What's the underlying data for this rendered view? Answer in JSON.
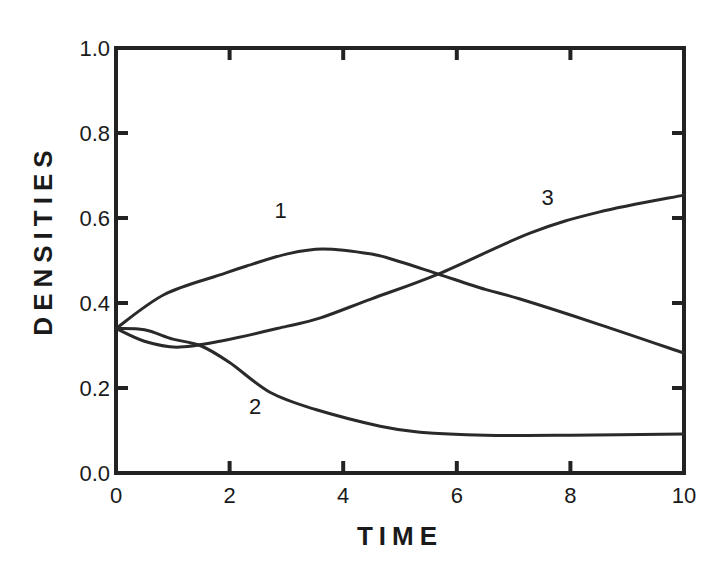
{
  "chart_data": {
    "type": "line",
    "title": "",
    "xlabel": "TIME",
    "ylabel": "DENSITIES",
    "xlim": [
      0,
      10
    ],
    "ylim": [
      0.0,
      1.0
    ],
    "x_ticks": [
      0,
      2,
      4,
      6,
      8,
      10
    ],
    "x_tick_labels": [
      "0",
      "2",
      "4",
      "6",
      "8",
      "10"
    ],
    "y_ticks": [
      0.0,
      0.2,
      0.4,
      0.6,
      0.8,
      1.0
    ],
    "y_tick_labels": [
      "0.0",
      "0.2",
      "0.4",
      "0.6",
      "0.8",
      "1.0"
    ],
    "grid": false,
    "legend": "inline curve labels",
    "series": [
      {
        "name": "1",
        "label_pos": [
          2.9,
          0.6
        ],
        "x": [
          0,
          0.85,
          1.83,
          2.3,
          3.0,
          3.64,
          4.5,
          5.0,
          5.67,
          6.5,
          7.1,
          8.5,
          10
        ],
        "values": [
          0.34,
          0.42,
          0.466,
          0.487,
          0.515,
          0.527,
          0.515,
          0.497,
          0.468,
          0.432,
          0.41,
          0.35,
          0.282
        ]
      },
      {
        "name": "2",
        "label_pos": [
          2.45,
          0.14
        ],
        "x": [
          0,
          0.5,
          1.0,
          1.48,
          2.0,
          2.71,
          3.5,
          4.65,
          5.35,
          6.5,
          8.0,
          10
        ],
        "values": [
          0.34,
          0.337,
          0.315,
          0.3,
          0.26,
          0.19,
          0.15,
          0.11,
          0.096,
          0.089,
          0.089,
          0.092
        ]
      },
      {
        "name": "3",
        "label_pos": [
          7.6,
          0.63
        ],
        "x": [
          0,
          0.5,
          1.07,
          1.83,
          3.0,
          3.6,
          4.5,
          5.67,
          7.3,
          8.5,
          10
        ],
        "values": [
          0.34,
          0.31,
          0.296,
          0.31,
          0.345,
          0.365,
          0.41,
          0.468,
          0.565,
          0.614,
          0.654
        ]
      }
    ]
  },
  "colors": {
    "line": "#2a2a2a",
    "frame": "#222222",
    "background": "#ffffff"
  }
}
